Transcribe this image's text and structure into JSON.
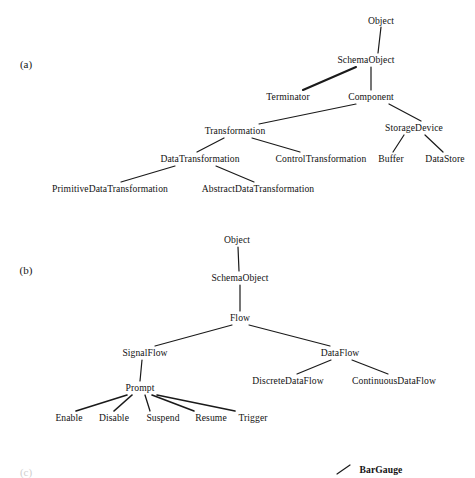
{
  "figure": {
    "background_color": "#ffffff",
    "text_color": "#121212",
    "edge_color": "#1a1a1a",
    "panels": [
      {
        "id": "a",
        "label": "(a)",
        "x": 26,
        "y": 64
      },
      {
        "id": "b",
        "label": "(b)",
        "x": 26,
        "y": 270
      },
      {
        "id": "c",
        "label": "(c)",
        "x": 26,
        "y": 472,
        "faint": true
      }
    ]
  },
  "diagram_a": {
    "title": "(a)",
    "type": "tree",
    "nodes": [
      {
        "id": "a_object",
        "label": "Object",
        "x": 381,
        "y": 21
      },
      {
        "id": "a_schemaobject",
        "label": "SchemaObject",
        "x": 366,
        "y": 60
      },
      {
        "id": "a_terminator",
        "label": "Terminator",
        "x": 288,
        "y": 97
      },
      {
        "id": "a_component",
        "label": "Component",
        "x": 371,
        "y": 97
      },
      {
        "id": "a_transformation",
        "label": "Transformation",
        "x": 235,
        "y": 131
      },
      {
        "id": "a_storagedevice",
        "label": "StorageDevice",
        "x": 414,
        "y": 128
      },
      {
        "id": "a_datatransformation",
        "label": "DataTransformation",
        "x": 200,
        "y": 159
      },
      {
        "id": "a_controltransformation",
        "label": "ControlTransformation",
        "x": 321,
        "y": 159
      },
      {
        "id": "a_buffer",
        "label": "Buffer",
        "x": 391,
        "y": 159
      },
      {
        "id": "a_datastore",
        "label": "DataStore",
        "x": 445,
        "y": 159
      },
      {
        "id": "a_primitivedatatransformation",
        "label": "PrimitiveDataTransformation",
        "x": 110,
        "y": 189
      },
      {
        "id": "a_abstractdatatransformation",
        "label": "AbstractDataTransformation",
        "x": 258,
        "y": 189
      }
    ],
    "edges": [
      {
        "from": "a_object",
        "to": "a_schemaobject"
      },
      {
        "from": "a_schemaobject",
        "to": "a_terminator"
      },
      {
        "from": "a_schemaobject",
        "to": "a_component"
      },
      {
        "from": "a_component",
        "to": "a_transformation"
      },
      {
        "from": "a_component",
        "to": "a_storagedevice"
      },
      {
        "from": "a_transformation",
        "to": "a_datatransformation"
      },
      {
        "from": "a_transformation",
        "to": "a_controltransformation"
      },
      {
        "from": "a_storagedevice",
        "to": "a_buffer"
      },
      {
        "from": "a_storagedevice",
        "to": "a_datastore"
      },
      {
        "from": "a_datatransformation",
        "to": "a_primitivedatatransformation"
      },
      {
        "from": "a_datatransformation",
        "to": "a_abstractdatatransformation"
      }
    ]
  },
  "diagram_b": {
    "title": "(b)",
    "type": "tree",
    "nodes": [
      {
        "id": "b_object",
        "label": "Object",
        "x": 237,
        "y": 240
      },
      {
        "id": "b_schemaobject",
        "label": "SchemaObject",
        "x": 240,
        "y": 278
      },
      {
        "id": "b_flow",
        "label": "Flow",
        "x": 240,
        "y": 318
      },
      {
        "id": "b_signalflow",
        "label": "SignalFlow",
        "x": 145,
        "y": 353
      },
      {
        "id": "b_dataflow",
        "label": "DataFlow",
        "x": 340,
        "y": 353
      },
      {
        "id": "b_prompt",
        "label": "Prompt",
        "x": 140,
        "y": 388
      },
      {
        "id": "b_discretedataflow",
        "label": "DiscreteDataFlow",
        "x": 288,
        "y": 381
      },
      {
        "id": "b_continuousdataflow",
        "label": "ContinuousDataFlow",
        "x": 394,
        "y": 381
      },
      {
        "id": "b_enable",
        "label": "Enable",
        "x": 69,
        "y": 418
      },
      {
        "id": "b_disable",
        "label": "Disable",
        "x": 114,
        "y": 418
      },
      {
        "id": "b_suspend",
        "label": "Suspend",
        "x": 163,
        "y": 418
      },
      {
        "id": "b_resume",
        "label": "Resume",
        "x": 211,
        "y": 418
      },
      {
        "id": "b_trigger",
        "label": "Trigger",
        "x": 253,
        "y": 418
      }
    ],
    "edges": [
      {
        "from": "b_object",
        "to": "b_schemaobject"
      },
      {
        "from": "b_schemaobject",
        "to": "b_flow"
      },
      {
        "from": "b_flow",
        "to": "b_signalflow"
      },
      {
        "from": "b_flow",
        "to": "b_dataflow"
      },
      {
        "from": "b_signalflow",
        "to": "b_prompt"
      },
      {
        "from": "b_dataflow",
        "to": "b_discretedataflow"
      },
      {
        "from": "b_dataflow",
        "to": "b_continuousdataflow"
      },
      {
        "from": "b_prompt",
        "to": "b_enable"
      },
      {
        "from": "b_prompt",
        "to": "b_disable"
      },
      {
        "from": "b_prompt",
        "to": "b_suspend"
      },
      {
        "from": "b_prompt",
        "to": "b_resume"
      },
      {
        "from": "b_prompt",
        "to": "b_trigger"
      }
    ]
  },
  "diagram_c": {
    "title": "(c)",
    "type": "tree",
    "note": "partially visible at bottom edge",
    "nodes": [
      {
        "id": "c_bargauge",
        "label": "BarGauge",
        "x": 381,
        "y": 470
      }
    ],
    "edges": [
      {
        "from": "c_parent_offscreen",
        "to": "c_bargauge"
      }
    ]
  }
}
